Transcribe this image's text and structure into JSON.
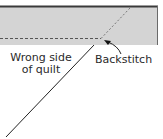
{
  "diagram": {
    "labels": {
      "wrong_side_line1": "Wrong side",
      "wrong_side_line2": "of quilt",
      "backstitch": "Backstitch"
    },
    "colors": {
      "fabric_fill": "#d4d4d4",
      "edge": "#3a3a3a",
      "stitch": "#555555",
      "line": "#222222"
    }
  }
}
